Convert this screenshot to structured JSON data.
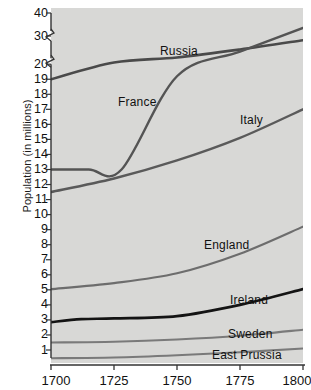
{
  "chart_data": {
    "type": "line",
    "title": "",
    "xlabel": "",
    "ylabel": "Population (in millions)",
    "x": [
      1700,
      1725,
      1750,
      1775,
      1800
    ],
    "xlim": [
      1700,
      1800
    ],
    "xticks": [
      "1700",
      "1725",
      "1750",
      "1775",
      "1800"
    ],
    "yticks": [
      "1",
      "2",
      "3",
      "4",
      "5",
      "6",
      "7",
      "8",
      "9",
      "10",
      "11",
      "12",
      "13",
      "14",
      "15",
      "16",
      "17",
      "18",
      "19",
      "20",
      "30",
      "40"
    ],
    "ylim": [
      0,
      40
    ],
    "axis_break": true,
    "grid": false,
    "legend": "inline-labels",
    "background": "#d8d8d6",
    "series": [
      {
        "name": "Russia",
        "label": "Russia",
        "color": "#4a4a4a",
        "width": 2.6,
        "points": [
          [
            1700,
            19.0
          ],
          [
            1725,
            20.6
          ],
          [
            1750,
            22.4
          ],
          [
            1775,
            25.2
          ],
          [
            1800,
            28.5
          ]
        ]
      },
      {
        "name": "France",
        "label": "France",
        "color": "#545454",
        "width": 2.4,
        "points": [
          [
            1700,
            13.0
          ],
          [
            1715,
            13.0
          ],
          [
            1728,
            13.0
          ],
          [
            1750,
            19.2
          ],
          [
            1775,
            24.5
          ],
          [
            1800,
            33.5
          ]
        ]
      },
      {
        "name": "Italy",
        "label": "Italy",
        "color": "#5a5a5a",
        "width": 2.4,
        "points": [
          [
            1700,
            11.5
          ],
          [
            1725,
            12.4
          ],
          [
            1750,
            13.6
          ],
          [
            1775,
            15.1
          ],
          [
            1800,
            17.0
          ]
        ]
      },
      {
        "name": "England",
        "label": "England",
        "color": "#6d6d6d",
        "width": 2.2,
        "points": [
          [
            1700,
            5.05
          ],
          [
            1725,
            5.45
          ],
          [
            1750,
            6.1
          ],
          [
            1775,
            7.4
          ],
          [
            1800,
            9.2
          ]
        ]
      },
      {
        "name": "Ireland",
        "label": "Ireland",
        "color": "#141414",
        "width": 2.6,
        "points": [
          [
            1700,
            2.85
          ],
          [
            1712,
            3.05
          ],
          [
            1725,
            3.1
          ],
          [
            1750,
            3.25
          ],
          [
            1775,
            4.0
          ],
          [
            1800,
            5.05
          ]
        ]
      },
      {
        "name": "Sweden",
        "label": "Sweden",
        "color": "#7a7a7a",
        "width": 2.1,
        "points": [
          [
            1700,
            1.5
          ],
          [
            1725,
            1.55
          ],
          [
            1750,
            1.7
          ],
          [
            1775,
            1.95
          ],
          [
            1800,
            2.35
          ]
        ]
      },
      {
        "name": "East Prussia",
        "label": "East Prussia",
        "color": "#7a7a7a",
        "width": 2.1,
        "points": [
          [
            1700,
            0.45
          ],
          [
            1725,
            0.5
          ],
          [
            1750,
            0.65
          ],
          [
            1775,
            0.85
          ],
          [
            1800,
            1.1
          ]
        ]
      }
    ],
    "series_labels": [
      {
        "text": "Russia",
        "x": 160,
        "y": 44
      },
      {
        "text": "France",
        "x": 118,
        "y": 95
      },
      {
        "text": "Italy",
        "x": 240,
        "y": 113
      },
      {
        "text": "England",
        "x": 204,
        "y": 238
      },
      {
        "text": "Ireland",
        "x": 230,
        "y": 293
      },
      {
        "text": "Sweden",
        "x": 228,
        "y": 327
      },
      {
        "text": "East Prussia",
        "x": 212,
        "y": 348
      }
    ]
  }
}
